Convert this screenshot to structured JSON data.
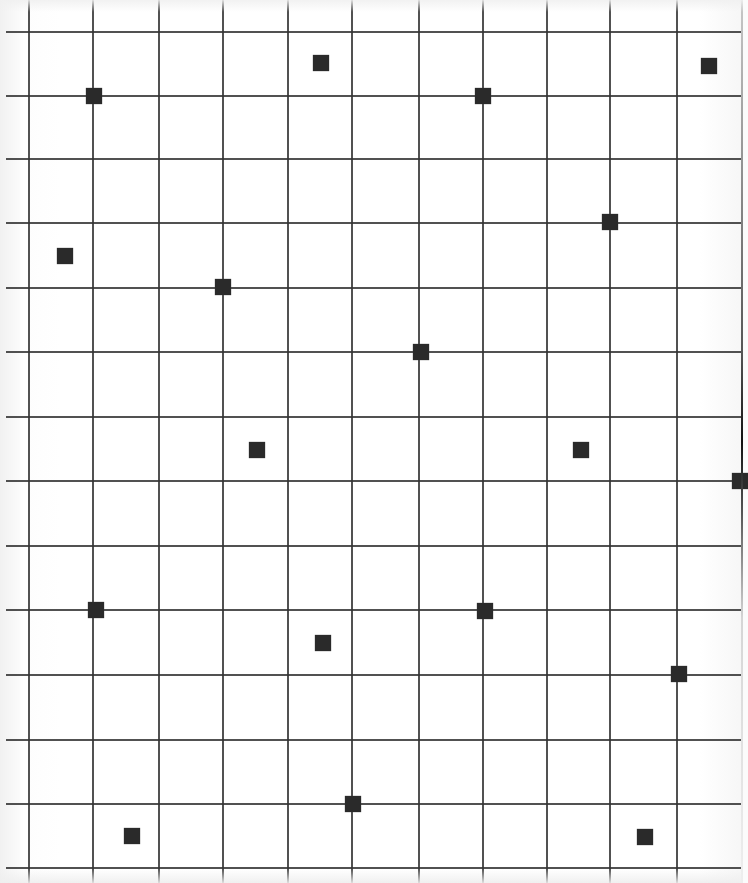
{
  "board": {
    "background_color": "#ffffff",
    "line_color": "#333333",
    "marker_color": "#2a2a2a",
    "marker_size": 16,
    "vertical_lines_x": [
      29,
      93,
      159,
      223,
      288,
      352,
      419,
      483,
      547,
      610,
      677
    ],
    "horizontal_lines_y": [
      32,
      96,
      159,
      223,
      288,
      352,
      417,
      481,
      546,
      610,
      675,
      740,
      804,
      868
    ],
    "markers": [
      {
        "x": 94,
        "y": 96
      },
      {
        "x": 321,
        "y": 63
      },
      {
        "x": 483,
        "y": 96
      },
      {
        "x": 709,
        "y": 66
      },
      {
        "x": 610,
        "y": 222
      },
      {
        "x": 65,
        "y": 256
      },
      {
        "x": 223,
        "y": 287
      },
      {
        "x": 421,
        "y": 352
      },
      {
        "x": 257,
        "y": 450
      },
      {
        "x": 581,
        "y": 450
      },
      {
        "x": 740,
        "y": 481
      },
      {
        "x": 96,
        "y": 610
      },
      {
        "x": 485,
        "y": 611
      },
      {
        "x": 323,
        "y": 643
      },
      {
        "x": 679,
        "y": 674
      },
      {
        "x": 353,
        "y": 804
      },
      {
        "x": 132,
        "y": 836
      },
      {
        "x": 645,
        "y": 837
      }
    ]
  }
}
